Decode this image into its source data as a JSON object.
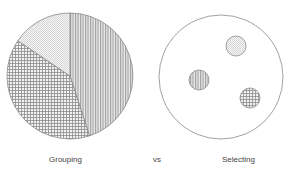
{
  "diagram": {
    "left": {
      "label": "Grouping",
      "type": "pie",
      "slices": [
        {
          "name": "vertical-stripes",
          "share": 0.45
        },
        {
          "name": "grid",
          "share": 0.37
        },
        {
          "name": "dots",
          "share": 0.18
        }
      ]
    },
    "middle": {
      "label": "vs"
    },
    "right": {
      "label": "Selecting",
      "type": "circle-with-samples",
      "samples": [
        {
          "name": "dots"
        },
        {
          "name": "vertical-stripes"
        },
        {
          "name": "grid"
        }
      ]
    }
  },
  "colors": {
    "outline": "#8a8a8a",
    "stripe": "#9a9a9a",
    "grid": "#8c8c8c",
    "dots": "#bdbdbd",
    "text": "#444444"
  }
}
